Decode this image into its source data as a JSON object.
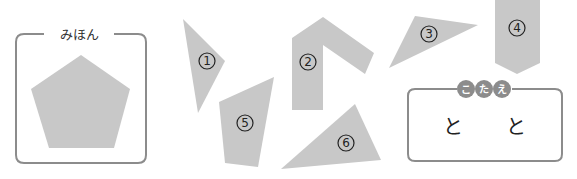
{
  "sample": {
    "title": "みほん",
    "shape": "pentagon"
  },
  "pieces": [
    {
      "number": "1",
      "shape": "triangle"
    },
    {
      "number": "2",
      "shape": "chevron-L"
    },
    {
      "number": "3",
      "shape": "triangle"
    },
    {
      "number": "4",
      "shape": "arrow-pentagon"
    },
    {
      "number": "5",
      "shape": "quadrilateral"
    },
    {
      "number": "6",
      "shape": "triangle"
    }
  ],
  "answer": {
    "badge_chars": [
      "こ",
      "た",
      "え"
    ],
    "text_1": "と",
    "text_2": "と"
  },
  "colors": {
    "shape_fill": "#c8c8c8",
    "frame_stroke": "#8c8c8c",
    "badge_fill": "#8c8c8c"
  }
}
